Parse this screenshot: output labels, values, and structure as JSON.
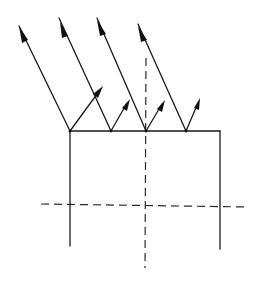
{
  "diagram": {
    "colors": {
      "line": "#1a1a1a",
      "background": "#ffffff"
    },
    "incident_rays": [
      {
        "from": [
          19,
          26
        ],
        "to": [
          70,
          131
        ]
      },
      {
        "from": [
          59,
          18
        ],
        "to": [
          111,
          131
        ]
      },
      {
        "from": [
          97,
          18
        ],
        "to": [
          146,
          131
        ]
      },
      {
        "from": [
          138,
          24
        ],
        "to": [
          186,
          131
        ]
      }
    ],
    "reflected_rays": [
      {
        "from": [
          70,
          131
        ],
        "to": [
          102,
          87
        ]
      },
      {
        "from": [
          111,
          131
        ],
        "to": [
          128,
          100
        ]
      },
      {
        "from": [
          146,
          131
        ],
        "to": [
          163,
          101
        ]
      },
      {
        "from": [
          186,
          131
        ],
        "to": [
          199,
          99
        ]
      }
    ],
    "body": {
      "top_surface": {
        "from": [
          70,
          131
        ],
        "to": [
          220,
          131
        ]
      },
      "left_side": {
        "from": [
          70,
          131
        ],
        "to": [
          70,
          246
        ]
      },
      "right_side": {
        "from": [
          220,
          131
        ],
        "to": [
          220,
          249
        ]
      }
    },
    "axes": {
      "vertical_dashed": {
        "from": [
          146,
          58
        ],
        "to": [
          145,
          268
        ]
      },
      "horizontal_dashed": {
        "from": [
          41,
          204
        ],
        "to": [
          248,
          207
        ]
      }
    }
  }
}
